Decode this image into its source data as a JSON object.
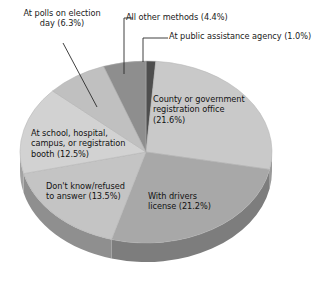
{
  "chart_data": {
    "type": "pie",
    "title": "",
    "subtitle": "",
    "xlabel": "",
    "ylabel": "",
    "grid": false,
    "legend_position": "none",
    "label_style": "callout-and-inner",
    "three_d": true,
    "categories": [
      "At public assistance agency",
      "County or government registration office",
      "With drivers license",
      "Don't know/refused to answer",
      "At school, hospital, campus, or registration booth",
      "At polls on election day",
      "All other methods"
    ],
    "values": [
      1.0,
      21.6,
      21.2,
      13.5,
      12.5,
      6.3,
      4.4
    ],
    "units": "percent",
    "slices": [
      {
        "name": "At public assistance agency",
        "value": 1.0,
        "label": "At public assistance agency (1.0%)",
        "color": "#4e4e4e",
        "side_color": "#343434",
        "label_placement": "callout"
      },
      {
        "name": "County or government registration office",
        "value": 21.6,
        "label": "County or government\nregistration office\n(21.6%)",
        "color": "#c9c9c9",
        "side_color": "#9a9a9a",
        "label_placement": "inner"
      },
      {
        "name": "With drivers license",
        "value": 21.2,
        "label": "With drivers\nlicense (21.2%)",
        "color": "#a8a8a8",
        "side_color": "#7d7d7d",
        "label_placement": "inner"
      },
      {
        "name": "Don't know/refused to answer",
        "value": 13.5,
        "label": "Don't know/refused\nto answer (13.5%)",
        "color": "#c4c4c4",
        "side_color": "#8f8f8f",
        "label_placement": "inner"
      },
      {
        "name": "At school, hospital, campus, or registration booth",
        "value": 12.5,
        "label": "At school, hospital,\ncampus, or registration\nbooth (12.5%)",
        "color": "#d2d2d2",
        "side_color": "#a2a2a2",
        "label_placement": "inner"
      },
      {
        "name": "At polls on election day",
        "value": 6.3,
        "label": "At polls on election\nday (6.3%)",
        "color": "#c0c0c0",
        "side_color": "#909090",
        "label_placement": "callout"
      },
      {
        "name": "All other methods",
        "value": 4.4,
        "label": "All other methods (4.4%)",
        "color": "#8e8e8e",
        "side_color": "#6a6a6a",
        "label_placement": "callout"
      }
    ],
    "colors": {
      "background": "#ffffff",
      "text": "#1a1a1a",
      "leader_line": "#2a2a2a"
    }
  }
}
